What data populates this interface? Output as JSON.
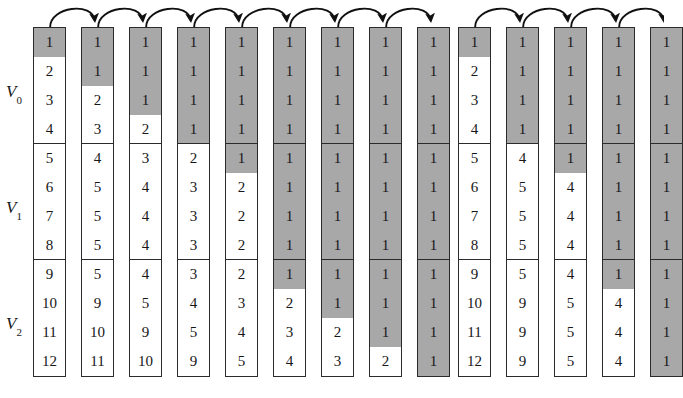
{
  "figure": {
    "type": "algorithm-trace-diagram",
    "row_count": 12,
    "cell_height_px": 29,
    "colors": {
      "shaded_cell": "#a8a8a8",
      "unshaded_cell": "#ffffff",
      "border": "#2b2b2b",
      "text": "#171717",
      "arrow": "#111111"
    }
  },
  "axis_labels": [
    {
      "name": "V0",
      "base": "V",
      "sub": "0",
      "rows": [
        1,
        2,
        3,
        4
      ],
      "x": 6,
      "y": 83
    },
    {
      "name": "V1",
      "base": "V",
      "sub": "1",
      "rows": [
        5,
        6,
        7,
        8
      ],
      "x": 6,
      "y": 199
    },
    {
      "name": "V2",
      "base": "V",
      "sub": "2",
      "rows": [
        9,
        10,
        11,
        12
      ],
      "x": 6,
      "y": 315
    }
  ],
  "groups": [
    {
      "id": "left-group",
      "name": "left-trace",
      "x": 33,
      "top": 27,
      "col_width": 33,
      "col_pitch": 48,
      "column_count": 9,
      "arrow_count": 8,
      "columns": [
        {
          "index": 1,
          "values": [
            "1",
            "2",
            "3",
            "4",
            "5",
            "6",
            "7",
            "8",
            "9",
            "10",
            "11",
            "12"
          ],
          "shaded": [
            true,
            false,
            false,
            false,
            false,
            false,
            false,
            false,
            false,
            false,
            false,
            false
          ],
          "separators": [
            "none",
            "dash",
            "dash",
            "solid",
            "dash",
            "dash",
            "dash",
            "solid",
            "none",
            "dash",
            "dash",
            "none"
          ]
        },
        {
          "index": 2,
          "values": [
            "1",
            "1",
            "2",
            "3",
            "4",
            "5",
            "5",
            "5",
            "5",
            "9",
            "10",
            "11"
          ],
          "shaded": [
            true,
            true,
            false,
            false,
            false,
            false,
            false,
            false,
            false,
            false,
            false,
            false
          ],
          "separators": [
            "none",
            "dash",
            "dash",
            "solid",
            "dash",
            "dash",
            "dash",
            "solid",
            "none",
            "dash",
            "dash",
            "none"
          ]
        },
        {
          "index": 3,
          "values": [
            "1",
            "1",
            "1",
            "2",
            "3",
            "4",
            "4",
            "4",
            "4",
            "5",
            "9",
            "10"
          ],
          "shaded": [
            true,
            true,
            true,
            false,
            false,
            false,
            false,
            false,
            false,
            false,
            false,
            false
          ],
          "separators": [
            "none",
            "dash",
            "dash",
            "solid",
            "dash",
            "dash",
            "dash",
            "solid",
            "none",
            "dash",
            "dash",
            "none"
          ]
        },
        {
          "index": 4,
          "values": [
            "1",
            "1",
            "1",
            "1",
            "2",
            "3",
            "3",
            "3",
            "3",
            "4",
            "5",
            "9"
          ],
          "shaded": [
            true,
            true,
            true,
            true,
            false,
            false,
            false,
            false,
            false,
            false,
            false,
            false
          ],
          "separators": [
            "none",
            "dash",
            "dash",
            "solid",
            "dash",
            "dash",
            "dash",
            "solid",
            "none",
            "dash",
            "dash",
            "none"
          ]
        },
        {
          "index": 5,
          "values": [
            "1",
            "1",
            "1",
            "1",
            "1",
            "2",
            "2",
            "2",
            "2",
            "3",
            "4",
            "5"
          ],
          "shaded": [
            true,
            true,
            true,
            true,
            true,
            false,
            false,
            false,
            false,
            false,
            false,
            false
          ],
          "separators": [
            "none",
            "dash",
            "dash",
            "solid",
            "dash",
            "dash",
            "dash",
            "solid",
            "none",
            "dash",
            "dash",
            "none"
          ]
        },
        {
          "index": 6,
          "values": [
            "1",
            "1",
            "1",
            "1",
            "1",
            "1",
            "1",
            "1",
            "1",
            "2",
            "3",
            "4"
          ],
          "shaded": [
            true,
            true,
            true,
            true,
            true,
            true,
            true,
            true,
            true,
            false,
            false,
            false
          ],
          "separators": [
            "none",
            "dash",
            "dash",
            "solid",
            "dash",
            "dash",
            "dash",
            "solid",
            "none",
            "dash",
            "dash",
            "none"
          ]
        },
        {
          "index": 7,
          "values": [
            "1",
            "1",
            "1",
            "1",
            "1",
            "1",
            "1",
            "1",
            "1",
            "1",
            "2",
            "3"
          ],
          "shaded": [
            true,
            true,
            true,
            true,
            true,
            true,
            true,
            true,
            true,
            true,
            false,
            false
          ],
          "separators": [
            "none",
            "dash",
            "dash",
            "solid",
            "dash",
            "dash",
            "dash",
            "solid",
            "none",
            "dash",
            "dash",
            "none"
          ]
        },
        {
          "index": 8,
          "values": [
            "1",
            "1",
            "1",
            "1",
            "1",
            "1",
            "1",
            "1",
            "1",
            "1",
            "1",
            "2"
          ],
          "shaded": [
            true,
            true,
            true,
            true,
            true,
            true,
            true,
            true,
            true,
            true,
            true,
            false
          ],
          "separators": [
            "none",
            "dash",
            "dash",
            "solid",
            "dash",
            "dash",
            "dash",
            "solid",
            "none",
            "dash",
            "dash",
            "none"
          ]
        },
        {
          "index": 9,
          "values": [
            "1",
            "1",
            "1",
            "1",
            "1",
            "1",
            "1",
            "1",
            "1",
            "1",
            "1",
            "1"
          ],
          "shaded": [
            true,
            true,
            true,
            true,
            true,
            true,
            true,
            true,
            true,
            true,
            true,
            true
          ],
          "separators": [
            "none",
            "dash",
            "dash",
            "solid",
            "dash",
            "dash",
            "dash",
            "solid",
            "none",
            "dash",
            "dash",
            "none"
          ]
        }
      ]
    },
    {
      "id": "right-group",
      "name": "right-trace",
      "x": 458,
      "top": 27,
      "col_width": 33,
      "col_pitch": 48,
      "column_count": 5,
      "arrow_count": 4,
      "columns": [
        {
          "index": 1,
          "values": [
            "1",
            "2",
            "3",
            "4",
            "5",
            "6",
            "7",
            "8",
            "9",
            "10",
            "11",
            "12"
          ],
          "shaded": [
            true,
            false,
            false,
            false,
            false,
            false,
            false,
            false,
            false,
            false,
            false,
            false
          ],
          "separators": [
            "dash",
            "none",
            "none",
            "solid",
            "none",
            "dash",
            "none",
            "solid",
            "dash",
            "none",
            "none",
            "none"
          ]
        },
        {
          "index": 2,
          "values": [
            "1",
            "1",
            "1",
            "1",
            "4",
            "5",
            "5",
            "5",
            "5",
            "9",
            "9",
            "9"
          ],
          "shaded": [
            true,
            true,
            true,
            true,
            false,
            false,
            false,
            false,
            false,
            false,
            false,
            false
          ],
          "separators": [
            "dash",
            "none",
            "none",
            "solid",
            "none",
            "dash",
            "none",
            "solid",
            "dash",
            "none",
            "none",
            "none"
          ]
        },
        {
          "index": 3,
          "values": [
            "1",
            "1",
            "1",
            "1",
            "1",
            "4",
            "4",
            "4",
            "4",
            "5",
            "5",
            "5"
          ],
          "shaded": [
            true,
            true,
            true,
            true,
            true,
            false,
            false,
            false,
            false,
            false,
            false,
            false
          ],
          "separators": [
            "dash",
            "none",
            "none",
            "solid",
            "none",
            "dash",
            "none",
            "solid",
            "dash",
            "none",
            "none",
            "none"
          ]
        },
        {
          "index": 4,
          "values": [
            "1",
            "1",
            "1",
            "1",
            "1",
            "1",
            "1",
            "1",
            "1",
            "4",
            "4",
            "4"
          ],
          "shaded": [
            true,
            true,
            true,
            true,
            true,
            true,
            true,
            true,
            true,
            false,
            false,
            false
          ],
          "separators": [
            "dash",
            "none",
            "none",
            "solid",
            "none",
            "dash",
            "none",
            "solid",
            "dash",
            "none",
            "none",
            "none"
          ]
        },
        {
          "index": 5,
          "values": [
            "1",
            "1",
            "1",
            "1",
            "1",
            "1",
            "1",
            "1",
            "1",
            "1",
            "1",
            "1"
          ],
          "shaded": [
            true,
            true,
            true,
            true,
            true,
            true,
            true,
            true,
            true,
            true,
            true,
            true
          ],
          "separators": [
            "dash",
            "none",
            "none",
            "solid",
            "none",
            "dash",
            "none",
            "solid",
            "dash",
            "none",
            "none",
            "none"
          ]
        }
      ]
    }
  ]
}
